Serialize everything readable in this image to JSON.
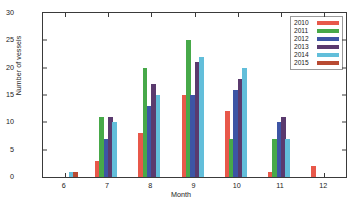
{
  "chart_data": {
    "type": "bar",
    "title": "",
    "xlabel": "Month",
    "ylabel": "Number of vessels",
    "categories": [
      "6",
      "7",
      "8",
      "9",
      "10",
      "11",
      "12"
    ],
    "ylim": [
      0,
      30
    ],
    "yticks": [
      0,
      5,
      10,
      15,
      20,
      25,
      30
    ],
    "grid": false,
    "legend_position": "top-right-inside",
    "series": [
      {
        "name": "2010",
        "color": "#E8584A",
        "values": [
          0,
          3,
          8,
          15,
          12,
          1,
          2
        ]
      },
      {
        "name": "2011",
        "color": "#47A949",
        "values": [
          0,
          11,
          20,
          25,
          7,
          7,
          0
        ]
      },
      {
        "name": "2012",
        "color": "#3D55A5",
        "values": [
          0,
          7,
          13,
          15,
          16,
          10,
          0
        ]
      },
      {
        "name": "2013",
        "color": "#5A3A6E",
        "values": [
          0,
          11,
          17,
          21,
          18,
          11,
          0
        ]
      },
      {
        "name": "2014",
        "color": "#62BEDA",
        "values": [
          1,
          10,
          15,
          22,
          20,
          7,
          0
        ]
      },
      {
        "name": "2015",
        "color": "#B84A32",
        "values": [
          1,
          0,
          0,
          0,
          0,
          0,
          0
        ]
      }
    ]
  },
  "axis": {
    "ylabel": "Number of vessels",
    "xlabel": "Month"
  }
}
